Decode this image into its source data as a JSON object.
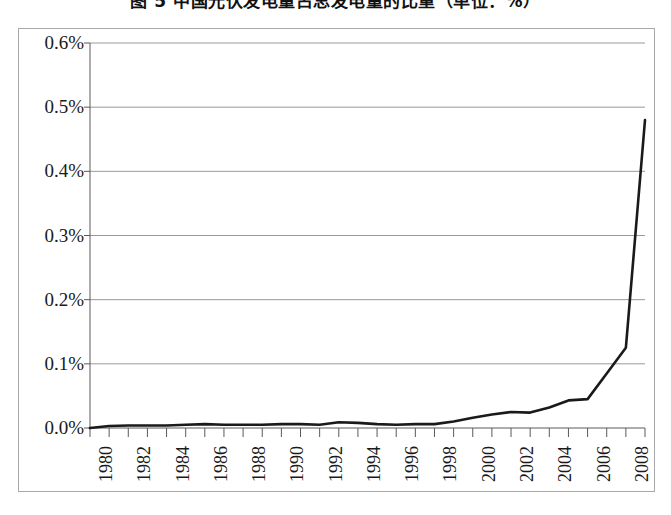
{
  "title": {
    "text": "图 5  中国光伏发电量占总发电量的比重（单位：%）",
    "note": "cut-off-at-top-edge"
  },
  "colors": {
    "line": "#1a1a1a",
    "gridline": "#9a9a9a",
    "axis": "#5a5a5a",
    "frame": "#a8a8a8",
    "background": "#ffffff",
    "text": "#1a1a1a"
  },
  "chart_data": {
    "type": "line",
    "title": "图 5  中国光伏发电量占总发电量的比重（单位：%）",
    "xlabel": "",
    "ylabel": "",
    "grid": true,
    "legend": false,
    "ylim": [
      0.0,
      0.6
    ],
    "ytick_values": [
      0.0,
      0.1,
      0.2,
      0.3,
      0.4,
      0.5,
      0.6
    ],
    "ytick_labels": [
      "0.0%",
      "0.1%",
      "0.2%",
      "0.3%",
      "0.4%",
      "0.5%",
      "0.6%"
    ],
    "x": [
      1980,
      1981,
      1982,
      1983,
      1984,
      1985,
      1986,
      1987,
      1988,
      1989,
      1990,
      1991,
      1992,
      1993,
      1994,
      1995,
      1996,
      1997,
      1998,
      1999,
      2000,
      2001,
      2002,
      2003,
      2004,
      2005,
      2006,
      2007,
      2008,
      2009
    ],
    "xtick_labels": [
      "1980",
      "1982",
      "1984",
      "1986",
      "1988",
      "1990",
      "1992",
      "1994",
      "1996",
      "1998",
      "2000",
      "2002",
      "2004",
      "2006",
      "2008"
    ],
    "xtick_label_rotation": 90,
    "xtick_label_interval": 2,
    "values": [
      0.0,
      0.003,
      0.004,
      0.004,
      0.004,
      0.005,
      0.006,
      0.005,
      0.005,
      0.005,
      0.006,
      0.006,
      0.005,
      0.009,
      0.008,
      0.006,
      0.005,
      0.006,
      0.006,
      0.01,
      0.016,
      0.021,
      0.025,
      0.024,
      0.032,
      0.043,
      0.045,
      0.085,
      0.125,
      0.48
    ],
    "series": [
      {
        "name": "占比",
        "values": [
          0.0,
          0.003,
          0.004,
          0.004,
          0.004,
          0.005,
          0.006,
          0.005,
          0.005,
          0.005,
          0.006,
          0.006,
          0.005,
          0.009,
          0.008,
          0.006,
          0.005,
          0.006,
          0.006,
          0.01,
          0.016,
          0.021,
          0.025,
          0.024,
          0.032,
          0.043,
          0.045,
          0.085,
          0.125,
          0.48
        ]
      }
    ]
  }
}
